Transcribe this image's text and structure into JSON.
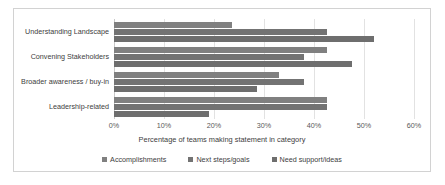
{
  "chart_data": {
    "type": "bar",
    "orientation": "horizontal",
    "title": "",
    "xlabel": "Percentage of teams making statement in category",
    "ylabel": "",
    "xlim": [
      0,
      60
    ],
    "xticks": [
      "0%",
      "10%",
      "20%",
      "30%",
      "40%",
      "50%",
      "60%"
    ],
    "xtick_values": [
      0,
      10,
      20,
      30,
      40,
      50,
      60
    ],
    "grid": true,
    "legend_position": "bottom",
    "categories": [
      "Understanding Landscape",
      "Convening Stakeholders",
      "Broader awareness / buy-in",
      "Leadership-related"
    ],
    "series": [
      {
        "name": "Accomplishments",
        "color": "#808080",
        "values": [
          23.5,
          42.5,
          33.0,
          42.5
        ]
      },
      {
        "name": "Next steps/goals",
        "color": "#737373",
        "values": [
          42.5,
          38.0,
          38.0,
          42.5
        ]
      },
      {
        "name": "Need support/ideas",
        "color": "#6e6e6e",
        "values": [
          52.0,
          47.5,
          28.5,
          19.0
        ]
      }
    ]
  }
}
